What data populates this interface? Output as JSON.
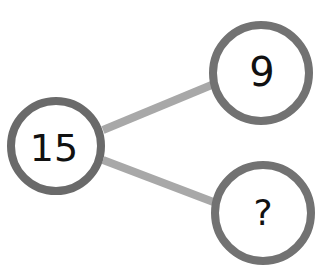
{
  "diagram": {
    "type": "number-bond",
    "whole": "15",
    "parts": [
      "9",
      "?"
    ],
    "colors": {
      "background": "#ffffff",
      "circle_stroke": "#6e6e6e",
      "line": "#a8a8a8",
      "text": "#111111"
    }
  }
}
